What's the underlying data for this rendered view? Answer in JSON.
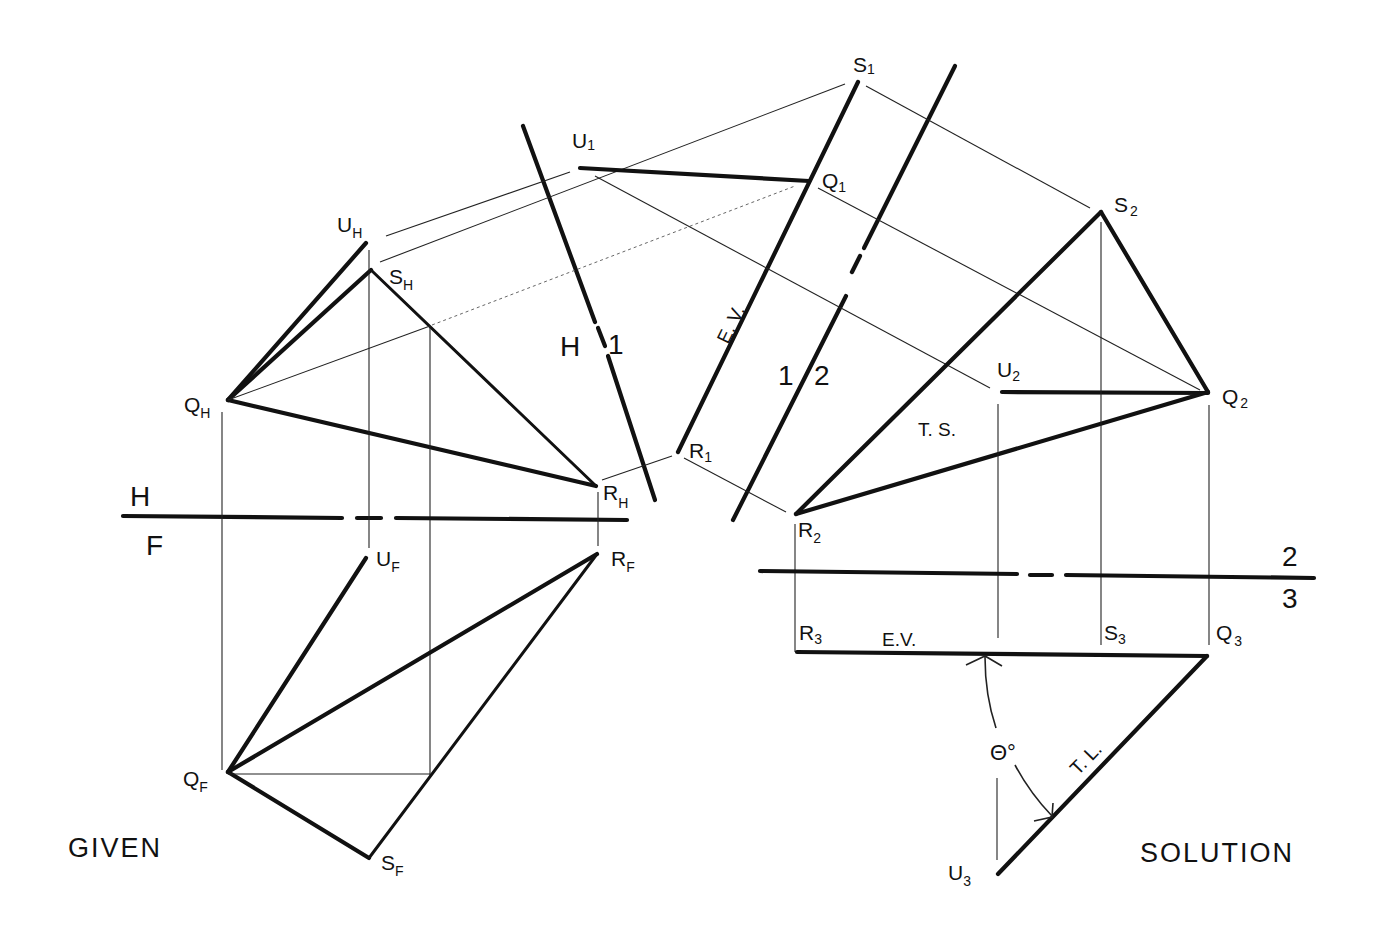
{
  "title_left": "GIVEN",
  "title_right": "SOLUTION",
  "fold_lines": {
    "hf": {
      "top": "H",
      "bottom": "F"
    },
    "h1": {
      "left": "H",
      "right": "1"
    },
    "v12": {
      "left": "1",
      "right": "2"
    },
    "v23": {
      "top": "2",
      "bottom": "3"
    }
  },
  "points": {
    "UH": {
      "main": "U",
      "sub": "H"
    },
    "SH": {
      "main": "S",
      "sub": "H"
    },
    "QH": {
      "main": "Q",
      "sub": "H"
    },
    "RH": {
      "main": "R",
      "sub": "H"
    },
    "UF": {
      "main": "U",
      "sub": "F"
    },
    "RF": {
      "main": "R",
      "sub": "F"
    },
    "QF": {
      "main": "Q",
      "sub": "F"
    },
    "SF": {
      "main": "S",
      "sub": "F"
    },
    "U1": {
      "main": "U",
      "sub": "1"
    },
    "S1": {
      "main": "S",
      "sub": "1"
    },
    "Q1": {
      "main": "Q",
      "sub": "1"
    },
    "R1": {
      "main": "R",
      "sub": "1"
    },
    "S2": {
      "main": "S",
      "sub": "2"
    },
    "U2": {
      "main": "U",
      "sub": "2"
    },
    "Q2": {
      "main": "Q",
      "sub": "2"
    },
    "R2": {
      "main": "R",
      "sub": "2"
    },
    "R3": {
      "main": "R",
      "sub": "3"
    },
    "S3": {
      "main": "S",
      "sub": "3"
    },
    "Q3": {
      "main": "Q",
      "sub": "3"
    },
    "U3": {
      "main": "U",
      "sub": "3"
    }
  },
  "annotations": {
    "ev_view1": "E. V.",
    "ts_view2": "T. S.",
    "ev_view3": "E.V.",
    "tl_view3": "T. L.",
    "angle": "Θ°"
  }
}
